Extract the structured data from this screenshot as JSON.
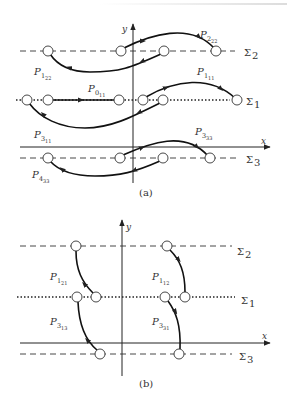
{
  "figure": {
    "panels": [
      {
        "caption": "(a)",
        "axes": {
          "x_label": "x",
          "y_label": "y"
        },
        "lines": [
          {
            "name": "Σ2",
            "style": "dashed"
          },
          {
            "name": "Σ1",
            "style": "dotted"
          },
          {
            "name": "Σ3",
            "style": "dashed"
          }
        ],
        "paths": [
          {
            "label": "P",
            "sub1": "2",
            "sub2": "22"
          },
          {
            "label": "P",
            "sub1": "1",
            "sub2": "22"
          },
          {
            "label": "P",
            "sub1": "1",
            "sub2": "11"
          },
          {
            "label": "P",
            "sub1": "0",
            "sub2": "11"
          },
          {
            "label": "P",
            "sub1": "3",
            "sub2": "11"
          },
          {
            "label": "P",
            "sub1": "3",
            "sub2": "33"
          },
          {
            "label": "P",
            "sub1": "4",
            "sub2": "33"
          }
        ]
      },
      {
        "caption": "(b)",
        "axes": {
          "x_label": "x",
          "y_label": "y"
        },
        "lines": [
          {
            "name": "Σ2",
            "style": "dashed"
          },
          {
            "name": "Σ1",
            "style": "dotted"
          },
          {
            "name": "Σ3",
            "style": "dashed"
          }
        ],
        "paths": [
          {
            "label": "P",
            "sub1": "1",
            "sub2": "21"
          },
          {
            "label": "P",
            "sub1": "1",
            "sub2": "12"
          },
          {
            "label": "P",
            "sub1": "3",
            "sub2": "13"
          },
          {
            "label": "P",
            "sub1": "3",
            "sub2": "31"
          }
        ]
      }
    ]
  },
  "sigma": {
    "s1": "Σ",
    "s1n": "1",
    "s2n": "2",
    "s3n": "3"
  }
}
